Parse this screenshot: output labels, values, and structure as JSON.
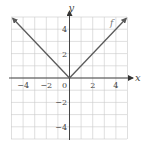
{
  "chart_data": {
    "type": "line",
    "title": "",
    "xlabel": "x",
    "ylabel": "y",
    "xlim": [
      -5,
      5
    ],
    "ylim": [
      -5,
      5
    ],
    "grid": true,
    "x_ticks": [
      -4,
      -2,
      0,
      2,
      4
    ],
    "y_ticks": [
      4,
      2,
      -2,
      -4
    ],
    "x_tick_labels": [
      "-4",
      "-2",
      "0",
      "2",
      "4"
    ],
    "y_tick_labels": [
      "4",
      "2",
      "-2",
      "-4"
    ],
    "series": [
      {
        "name": "f",
        "label": "f",
        "label_at": [
          3.5,
          4.3
        ],
        "x": [
          -4.9,
          0,
          4.9
        ],
        "y": [
          4.9,
          0,
          4.9
        ],
        "arrows": "both-ends"
      }
    ]
  }
}
